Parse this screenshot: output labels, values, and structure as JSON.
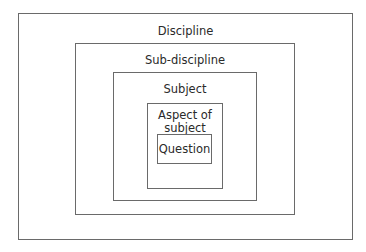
{
  "diagram": {
    "type": "nested-boxes",
    "levels": [
      {
        "label": "Discipline"
      },
      {
        "label": "Sub-discipline"
      },
      {
        "label": "Subject"
      },
      {
        "label": "Aspect of subject",
        "line1": "Aspect of",
        "line2": "subject"
      },
      {
        "label": "Question"
      }
    ]
  }
}
